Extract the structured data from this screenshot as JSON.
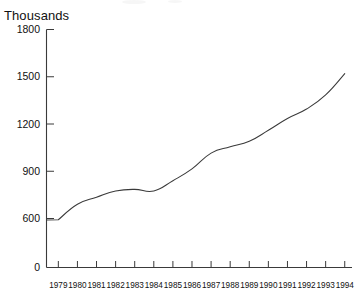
{
  "chart_data": {
    "type": "line",
    "title": "",
    "subtitle": "",
    "xlabel": "",
    "ylabel": "Thousands",
    "ylim": [
      0,
      1800
    ],
    "grid": false,
    "legend": null,
    "y_axis_broken_between": [
      0,
      600
    ],
    "ytick_labels": [
      "1800",
      "1500",
      "1200",
      "900",
      "600",
      "0"
    ],
    "ytick_values": [
      1800,
      1500,
      1200,
      900,
      600,
      0
    ],
    "categories": [
      "1979",
      "1980",
      "1981",
      "1982",
      "1983",
      "1984",
      "1985",
      "1986",
      "1987",
      "1988",
      "1989",
      "1990",
      "1991",
      "1992",
      "1993",
      "1994"
    ],
    "x": [
      1979,
      1980,
      1981,
      1982,
      1983,
      1984,
      1985,
      1986,
      1987,
      1988,
      1989,
      1990,
      1991,
      1992,
      1993,
      1994
    ],
    "values": [
      585,
      690,
      735,
      775,
      785,
      775,
      840,
      915,
      1015,
      1055,
      1090,
      1160,
      1235,
      1295,
      1385,
      1520
    ],
    "series": [
      {
        "name": "Thousands",
        "values": [
          585,
          690,
          735,
          775,
          785,
          775,
          840,
          915,
          1015,
          1055,
          1090,
          1160,
          1235,
          1295,
          1385,
          1520
        ]
      }
    ],
    "colors": {
      "line": "#3a3a3a",
      "axis": "#3a3a3a",
      "text": "#111111",
      "background": "#ffffff"
    }
  }
}
